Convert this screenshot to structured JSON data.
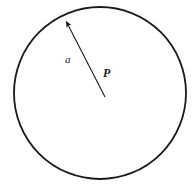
{
  "figure": {
    "kind": "geometry-diagram",
    "background_color": "#ffffff",
    "stroke_color": "#1a1a1a",
    "text_color": "#1a1a1a",
    "canvas": {
      "width": 194,
      "height": 192
    },
    "circle": {
      "name": "circle-outline",
      "center_x": 100,
      "center_y": 93,
      "radius": 86,
      "stroke_width": 1.8,
      "fill": "none"
    },
    "radius_arrow": {
      "name": "radius-arrow",
      "from_x": 105,
      "from_y": 97,
      "to_x": 64,
      "to_y": 17,
      "stroke_width": 1.1,
      "arrowhead": "filled-triangle"
    },
    "labels": {
      "radius": "a",
      "center_point": "P"
    }
  }
}
